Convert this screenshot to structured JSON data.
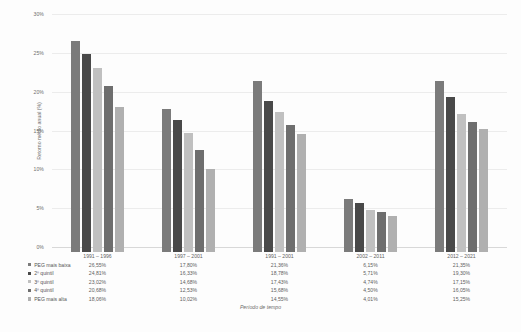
{
  "chart_data": {
    "type": "bar",
    "title": "",
    "xlabel": "Período de tempo",
    "ylabel": "Retorno médio anual (%)",
    "ylim": [
      0,
      30
    ],
    "ytick_labels": [
      "0%",
      "5%",
      "10%",
      "15%",
      "20%",
      "25%",
      "30%"
    ],
    "ytick_values": [
      0,
      5,
      10,
      15,
      20,
      25,
      30
    ],
    "grid": true,
    "legend_position": "bottom-table",
    "categories": [
      "1991 – 1996",
      "1997 – 2001",
      "1991 – 2001",
      "2002 – 2011",
      "2012 – 2021"
    ],
    "series": [
      {
        "name": "PEG mais baixa",
        "color": "#7b7b7b",
        "values": [
          26.55,
          17.8,
          21.36,
          6.15,
          21.35
        ],
        "labels": [
          "26,55%",
          "17,80%",
          "21,36%",
          "6,15%",
          "21,35%"
        ]
      },
      {
        "name": "2º quintil",
        "color": "#494949",
        "values": [
          24.81,
          16.33,
          18.78,
          5.71,
          19.3
        ],
        "labels": [
          "24,81%",
          "16,33%",
          "18,78%",
          "5,71%",
          "19,30%"
        ]
      },
      {
        "name": "3º quintil",
        "color": "#c0c0c0",
        "values": [
          23.02,
          14.68,
          17.43,
          4.74,
          17.15
        ],
        "labels": [
          "23,02%",
          "14,68%",
          "17,43%",
          "4,74%",
          "17,15%"
        ]
      },
      {
        "name": "4º quintil",
        "color": "#6e6e6e",
        "values": [
          20.68,
          12.53,
          15.68,
          4.5,
          16.05
        ],
        "labels": [
          "20,68%",
          "12,53%",
          "15,68%",
          "4,50%",
          "16,05%"
        ]
      },
      {
        "name": "PEG mais alta",
        "color": "#b0b0b0",
        "values": [
          18.06,
          10.02,
          14.55,
          4.01,
          15.25
        ],
        "labels": [
          "18,06%",
          "10,02%",
          "14,55%",
          "4,01%",
          "15,25%"
        ]
      }
    ]
  }
}
